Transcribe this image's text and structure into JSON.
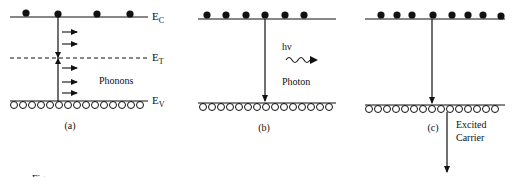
{
  "panels": {
    "a": {
      "caption": "(a)",
      "label_ec": "E",
      "label_ec_sub": "C",
      "label_et": "E",
      "label_et_sub": "T",
      "label_ev": "E",
      "label_ev_sub": "V",
      "phonons_label": "Phonons"
    },
    "b": {
      "caption": "(b)",
      "hv_label": "hν",
      "photon_label": "Photon"
    },
    "c": {
      "caption": "(c)",
      "excited_label_1": "Excited",
      "excited_label_2": "Carrier"
    }
  },
  "figure_caption_fragment": "Fig."
}
